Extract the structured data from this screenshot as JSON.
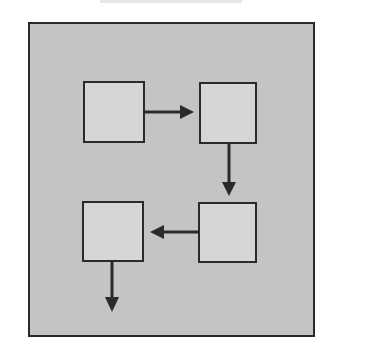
{
  "diagram": {
    "type": "flow",
    "frame_color": "#c4c4c4",
    "box_color": "#d6d6d6",
    "stroke_color": "#2a2a2a",
    "nodes": [
      {
        "id": "box-1",
        "label": ""
      },
      {
        "id": "box-2",
        "label": ""
      },
      {
        "id": "box-3",
        "label": ""
      },
      {
        "id": "box-4",
        "label": ""
      }
    ],
    "edges": [
      {
        "from": "box-1",
        "to": "box-2",
        "direction": "right"
      },
      {
        "from": "box-2",
        "to": "box-3",
        "direction": "down"
      },
      {
        "from": "box-3",
        "to": "box-4",
        "direction": "left"
      },
      {
        "from": "box-4",
        "to": "exit",
        "direction": "down"
      }
    ]
  }
}
